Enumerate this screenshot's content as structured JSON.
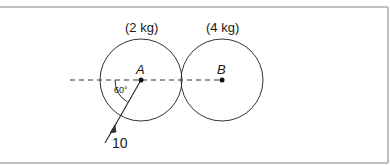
{
  "diagram": {
    "colors": {
      "stroke": "#333333",
      "frame": "#a8a8a8",
      "background": "#ffffff"
    },
    "bodies": [
      {
        "name": "A",
        "mass_label": "(2 kg)",
        "point_label": "A"
      },
      {
        "name": "B",
        "mass_label": "(4 kg)",
        "point_label": "B"
      }
    ],
    "angle_label": "60°",
    "force_label": "10"
  }
}
